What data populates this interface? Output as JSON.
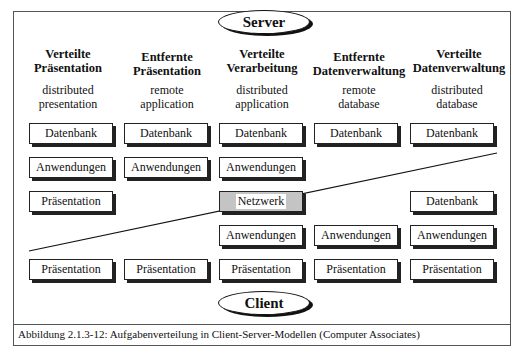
{
  "server_label": "Server",
  "client_label": "Client",
  "caption": "Abbildung 2.1.3-12: Aufgabenverteilung in Client-Server-Modellen (Computer Associates)",
  "columns": [
    {
      "title_1": "Verteilte",
      "title_2": "Präsentation",
      "sub_1": "distributed",
      "sub_2": "presentation"
    },
    {
      "title_1": "Entfernte",
      "title_2": "Präsentation",
      "sub_1": "remote",
      "sub_2": "application"
    },
    {
      "title_1": "Verteilte",
      "title_2": "Verarbeitung",
      "sub_1": "distributed",
      "sub_2": "application"
    },
    {
      "title_1": "Entfernte",
      "title_2": "Datenverwaltung",
      "sub_1": "remote",
      "sub_2": "database"
    },
    {
      "title_1": "Verteilte",
      "title_2": "Datenverwaltung",
      "sub_1": "distributed",
      "sub_2": "database"
    }
  ],
  "boxes": {
    "datenbank": "Datenbank",
    "anwendungen": "Anwendungen",
    "praesentation": "Präsentation",
    "netzwerk": "Netzwerk"
  }
}
